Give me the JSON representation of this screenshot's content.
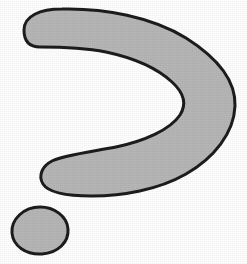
{
  "figure": {
    "title": "Crescent hook shape with small oval",
    "background_color": "#ffffff",
    "canvas": {
      "width": 247,
      "height": 264
    },
    "shapes": [
      {
        "name": "crescent-hook",
        "description": "Large gray crescent / boomerang hook opening to the left, resembling a greater-than sign",
        "fill_color": "#b7b7b7",
        "outline_color": "#1c1c1c",
        "outline_width": 3,
        "bounds": {
          "x": 22,
          "y": 8,
          "width": 214,
          "height": 190
        },
        "path": "M 24 30 C 24 16, 40 9, 62 9 C 104 8, 152 17, 186 38 C 216 57, 236 80, 235 106 C 234 133, 214 158, 186 174 C 158 190, 122 196, 92 196 C 66 196, 48 192, 43 184 C 38 176, 42 166, 52 161 C 64 155, 90 152, 116 147 C 144 141, 170 130, 180 115 C 187 104, 184 93, 172 82 C 158 69, 134 58, 106 52 C 80 47, 54 47, 40 47 C 28 47, 24 40, 24 30 Z"
      },
      {
        "name": "small-oval-blob",
        "description": "Small gray rounded blob below and to the left of the crescent",
        "fill_color": "#b7b7b7",
        "outline_color": "#1c1c1c",
        "outline_width": 3,
        "bounds": {
          "x": 11,
          "y": 206,
          "width": 58,
          "height": 49
        },
        "path": "M 40 207 C 54 207, 67 216, 68 229 C 69 242, 58 253, 42 254 C 26 255, 13 246, 12 233 C 11 219, 24 207, 40 207 Z"
      }
    ]
  }
}
